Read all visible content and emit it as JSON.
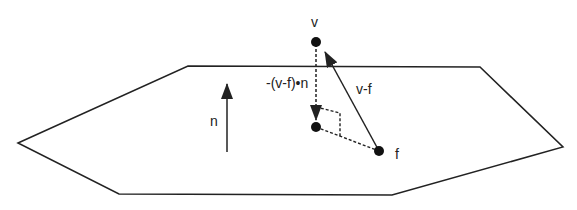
{
  "diagram": {
    "colors": {
      "stroke": "#222222",
      "background": "#ffffff"
    },
    "polygon": {
      "points": [
        [
          18,
          143
        ],
        [
          188,
          66
        ],
        [
          480,
          67
        ],
        [
          563,
          147
        ],
        [
          392,
          195
        ],
        [
          119,
          194
        ]
      ]
    },
    "points": {
      "v": {
        "label": "v",
        "x": 316,
        "y": 42
      },
      "projection": {
        "label": "",
        "x": 316,
        "y": 127
      },
      "f": {
        "label": "f",
        "x": 379,
        "y": 151
      }
    },
    "labels": {
      "v": "v",
      "f": "f",
      "n": "n",
      "v_minus_f": "v-f",
      "neg_projection": "-(v-f)•n"
    },
    "normal_arrow": {
      "label": "n",
      "x": 227,
      "y_start": 152,
      "y_end": 83
    }
  }
}
